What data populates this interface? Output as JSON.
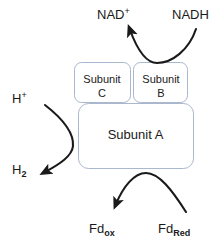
{
  "diagram": {
    "background_color": "#ffffff",
    "box_border_color": "#aab7cc",
    "box_fill_color": "#ffffff",
    "arrow_color": "#1a1a1a",
    "text_color": "#1a1a1a"
  },
  "boxes": [
    {
      "id": "subunit-c",
      "name_line1": "Subunit",
      "name_line2": "C"
    },
    {
      "id": "subunit-b",
      "name_line1": "Subunit",
      "name_line2": "B"
    },
    {
      "id": "subunit-a",
      "name_line1": "Subunit A",
      "name_line2": ""
    }
  ],
  "species": {
    "nad_plus": {
      "base": "NAD",
      "sup": "+",
      "sub": ""
    },
    "nadh": {
      "base": "NADH",
      "sup": "",
      "sub": ""
    },
    "h_plus": {
      "base": "H",
      "sup": "+",
      "sub": ""
    },
    "h2": {
      "base": "H",
      "sup": "",
      "sub": "2"
    },
    "fd_ox": {
      "base": "Fd",
      "sup": "",
      "sub": "ox"
    },
    "fd_red": {
      "base": "Fd",
      "sup": "",
      "sub": "Red"
    }
  },
  "arrows": [
    {
      "id": "nadh-to-nad",
      "from_label": "NADH",
      "to_label": "NAD+",
      "shape": "u-curve",
      "arrowhead_at": "to_label"
    },
    {
      "id": "hplus-to-h2",
      "from_label": "H+",
      "to_label": "H2",
      "shape": "right-bulge-curve",
      "arrowhead_at": "to_label"
    },
    {
      "id": "fdred-to-fdox",
      "from_label": "FdRed",
      "to_label": "Fdox",
      "shape": "arch-curve",
      "arrowhead_at": "to_label"
    }
  ]
}
